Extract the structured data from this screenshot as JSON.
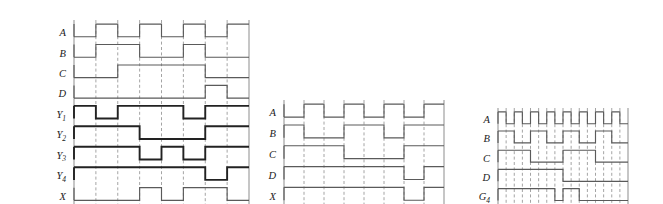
{
  "figure": {
    "type": "digital-timing-waveform-diagram",
    "background_color": "#ffffff",
    "signal_color": "#5a5a5a",
    "emphasis_color": "#222222",
    "grid_color": "#8d8d8d",
    "label_color": "#1b1b1b",
    "panel_count": 3
  },
  "panels": [
    {
      "id": "panel-left",
      "name": "left-timing-panel",
      "x": 48,
      "y": 16,
      "width": 175,
      "height": 184,
      "columns": 8,
      "grid_lines": [
        0,
        21.875,
        43.75,
        65.625,
        87.5,
        109.375,
        131.25,
        153.125,
        175
      ],
      "signals": [
        {
          "label": "A",
          "sub": "",
          "name": "signal-a",
          "row": 0,
          "emphasis": false,
          "levels": [
            0,
            1,
            0,
            1,
            0,
            1,
            0,
            1
          ],
          "description": "clock, period 2 columns"
        },
        {
          "label": "B",
          "sub": "",
          "name": "signal-b",
          "row": 1,
          "emphasis": false,
          "levels": [
            0,
            1,
            1,
            0,
            0,
            1,
            0,
            0
          ],
          "description": "high on columns 2-3 and 6"
        },
        {
          "label": "C",
          "sub": "",
          "name": "signal-c",
          "row": 2,
          "emphasis": false,
          "levels": [
            0,
            0,
            1,
            1,
            1,
            1,
            0,
            0
          ],
          "description": "high on columns 3-6"
        },
        {
          "label": "D",
          "sub": "",
          "name": "signal-d",
          "row": 3,
          "emphasis": false,
          "levels": [
            0,
            0,
            0,
            0,
            0,
            0,
            1,
            0
          ],
          "description": "high on column 7 only"
        },
        {
          "label": "Y",
          "sub": "1",
          "name": "signal-y1",
          "row": 4,
          "emphasis": true,
          "levels": [
            1,
            0,
            1,
            1,
            1,
            0,
            1,
            1
          ],
          "description": "low pulses on columns 2 and 6"
        },
        {
          "label": "Y",
          "sub": "2",
          "name": "signal-y2",
          "row": 5,
          "emphasis": true,
          "levels": [
            1,
            1,
            1,
            0,
            0,
            0,
            1,
            1
          ],
          "description": "low on columns 4-6"
        },
        {
          "label": "Y",
          "sub": "3",
          "name": "signal-y3",
          "row": 6,
          "emphasis": true,
          "levels": [
            1,
            1,
            1,
            0,
            1,
            0,
            1,
            1
          ],
          "description": "low on column 4 and column 6"
        },
        {
          "label": "Y",
          "sub": "4",
          "name": "signal-y4",
          "row": 7,
          "emphasis": true,
          "levels": [
            1,
            1,
            1,
            1,
            1,
            1,
            0,
            1
          ],
          "description": "low on column 7"
        },
        {
          "label": "X",
          "sub": "",
          "name": "signal-x",
          "row": 8,
          "emphasis": false,
          "levels": [
            0,
            0,
            0,
            1,
            0,
            1,
            1,
            0
          ],
          "description": "output pulses"
        }
      ]
    },
    {
      "id": "panel-middle",
      "name": "middle-timing-panel",
      "x": 258,
      "y": 96,
      "width": 160,
      "height": 104,
      "columns": 8,
      "grid_lines": [
        0,
        20,
        40,
        60,
        80,
        100,
        120,
        140,
        160
      ],
      "signals": [
        {
          "label": "A",
          "sub": "",
          "name": "signal-a",
          "row": 0,
          "emphasis": false,
          "levels": [
            0,
            1,
            0,
            1,
            0,
            1,
            0,
            1
          ],
          "description": "clock, period 2 columns"
        },
        {
          "label": "B",
          "sub": "",
          "name": "signal-b",
          "row": 1,
          "emphasis": false,
          "levels": [
            1,
            0,
            0,
            1,
            1,
            0,
            1,
            1
          ],
          "description": "toggles every two columns"
        },
        {
          "label": "C",
          "sub": "",
          "name": "signal-c",
          "row": 2,
          "emphasis": false,
          "levels": [
            1,
            1,
            1,
            0,
            0,
            0,
            1,
            1
          ],
          "description": "low on columns 4-6"
        },
        {
          "label": "D",
          "sub": "",
          "name": "signal-d",
          "row": 3,
          "emphasis": false,
          "levels": [
            1,
            1,
            1,
            1,
            1,
            1,
            0,
            1
          ],
          "description": "low on column 7"
        },
        {
          "label": "X",
          "sub": "",
          "name": "signal-x",
          "row": 4,
          "emphasis": false,
          "levels": [
            1,
            1,
            1,
            1,
            1,
            1,
            0,
            1
          ],
          "description": "output, low pulse on column 7"
        }
      ]
    },
    {
      "id": "panel-right",
      "name": "right-timing-panel",
      "x": 472,
      "y": 104,
      "width": 130,
      "height": 96,
      "columns": 16,
      "grid_lines": [
        0,
        8.125,
        16.25,
        24.375,
        32.5,
        40.625,
        48.75,
        56.875,
        65,
        73.125,
        81.25,
        89.375,
        97.5,
        105.625,
        113.75,
        121.875,
        130
      ],
      "signals": [
        {
          "label": "A",
          "sub": "",
          "name": "signal-a",
          "row": 0,
          "emphasis": false,
          "levels": [
            1,
            0,
            1,
            0,
            1,
            0,
            1,
            0,
            1,
            0,
            1,
            0,
            1,
            0,
            1,
            0
          ],
          "description": "fast clock, period 2 columns"
        },
        {
          "label": "B",
          "sub": "",
          "name": "signal-b",
          "row": 1,
          "emphasis": false,
          "levels": [
            1,
            1,
            0,
            0,
            1,
            1,
            0,
            0,
            1,
            1,
            0,
            0,
            1,
            1,
            0,
            0
          ],
          "description": "divide-by-2 clock"
        },
        {
          "label": "C",
          "sub": "",
          "name": "signal-c",
          "row": 2,
          "emphasis": false,
          "levels": [
            1,
            1,
            1,
            1,
            0,
            0,
            0,
            0,
            1,
            1,
            1,
            1,
            0,
            0,
            0,
            0
          ],
          "description": "divide-by-4 clock"
        },
        {
          "label": "D",
          "sub": "",
          "name": "signal-d",
          "row": 3,
          "emphasis": false,
          "levels": [
            1,
            1,
            1,
            1,
            1,
            1,
            1,
            1,
            0,
            0,
            0,
            0,
            0,
            0,
            0,
            0
          ],
          "description": "divide-by-8 clock"
        },
        {
          "label": "G",
          "sub": "4",
          "name": "signal-g4",
          "row": 4,
          "emphasis": false,
          "levels": [
            1,
            1,
            1,
            1,
            1,
            1,
            1,
            0,
            1,
            1,
            0,
            0,
            0,
            0,
            0,
            0
          ],
          "description": "gate output with low pulses"
        }
      ]
    }
  ],
  "chart_data": {
    "type": "line",
    "title": "",
    "xlabel": "",
    "ylabel": ""
  }
}
